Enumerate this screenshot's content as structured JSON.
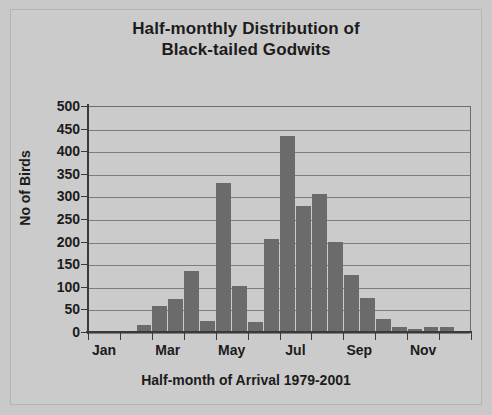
{
  "chart_data": {
    "type": "bar",
    "title": "Half-monthly Distribution of Black-tailed Godwits",
    "title_lines": [
      "Half-monthly Distribution of",
      "Black-tailed Godwits"
    ],
    "xlabel": "Half-month of Arrival 1979-2001",
    "ylabel": "No of Birds",
    "ylim": [
      0,
      500
    ],
    "ytick_labels": [
      "500",
      "450",
      "400",
      "350",
      "300",
      "250",
      "200",
      "150",
      "100",
      "50",
      "0"
    ],
    "ytick_values": [
      500,
      450,
      400,
      350,
      300,
      250,
      200,
      150,
      100,
      50,
      0
    ],
    "xtick_labels": [
      "Jan",
      "Mar",
      "May",
      "Jul",
      "Sep",
      "Nov"
    ],
    "grid": true,
    "legend": "none",
    "bar_color": "#6b6b6b",
    "categories": [
      "Jan-1",
      "Jan-2",
      "Feb-1",
      "Feb-2",
      "Mar-1",
      "Mar-2",
      "Apr-1",
      "Apr-2",
      "May-1",
      "May-2",
      "Jun-1",
      "Jun-2",
      "Jul-1",
      "Jul-2",
      "Aug-1",
      "Aug-2",
      "Sep-1",
      "Sep-2",
      "Oct-1",
      "Oct-2",
      "Nov-1",
      "Nov-2",
      "Dec-1",
      "Dec-2"
    ],
    "values": [
      0,
      2,
      2,
      15,
      58,
      72,
      135,
      25,
      330,
      102,
      22,
      205,
      433,
      278,
      305,
      200,
      127,
      75,
      28,
      10,
      7,
      10,
      10,
      2
    ]
  }
}
